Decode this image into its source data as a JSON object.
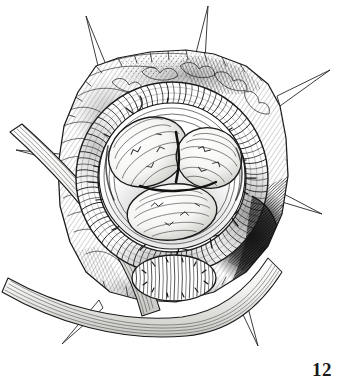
{
  "figure": {
    "number_label": "12",
    "caption": "Pen-and-ink surgical exposure: a ribbed coiled ring of tissue encircling three ovoid lobes within a retracted operative field.",
    "medium": "pen-and-ink line drawing",
    "background_color": "#ffffff",
    "ink_color": "#1a1a1a",
    "shadow_color": "#2b2b2b",
    "hatch_color": "#4a4a4a",
    "highlight_color": "#f7f7f5"
  },
  "illustration": {
    "canvas": {
      "width": 340,
      "height": 391
    },
    "field": {
      "name": "retracted-tissue-field",
      "outline": "M 96,66 L 118,58 L 150,52 L 186,50 L 214,54 L 246,66 L 268,84 L 280,106 L 286,138 L 288,176 L 282,214 L 268,246 L 246,272 L 214,292 L 176,302 L 140,300 L 110,292 L 86,272 L 70,242 L 60,206 L 58,166 L 64,126 L 78,92 Z",
      "description": "irregular polygonal wound margin held open"
    },
    "retractor_spikes": [
      {
        "name": "spike-top-left",
        "tip_x": 86,
        "tip_y": 16,
        "base_x": 104,
        "base_y": 70,
        "base_w": 9
      },
      {
        "name": "spike-top-right",
        "tip_x": 208,
        "tip_y": 6,
        "base_x": 200,
        "base_y": 58,
        "base_w": 9
      },
      {
        "name": "spike-right-upper",
        "tip_x": 330,
        "tip_y": 70,
        "base_x": 282,
        "base_y": 100,
        "base_w": 9
      },
      {
        "name": "spike-right-lower",
        "tip_x": 322,
        "tip_y": 214,
        "base_x": 284,
        "base_y": 200,
        "base_w": 8
      },
      {
        "name": "spike-bottom-right",
        "tip_x": 258,
        "tip_y": 346,
        "base_x": 240,
        "base_y": 300,
        "base_w": 8
      },
      {
        "name": "spike-bottom-left",
        "tip_x": 62,
        "tip_y": 344,
        "base_x": 96,
        "base_y": 298,
        "base_w": 8
      },
      {
        "name": "spike-left",
        "tip_x": 16,
        "tip_y": 150,
        "base_x": 60,
        "base_y": 160,
        "base_w": 8
      }
    ],
    "outer_ring": {
      "name": "coiled-ribbed-ring",
      "center_x": 172,
      "center_y": 178,
      "radius_outer": 96,
      "radius_inner": 74,
      "rib_count": 92,
      "description": "thick rope-like coil with transverse ribs and branching surface vessels"
    },
    "inner_basin": {
      "name": "inner-cavity-rim",
      "center_x": 172,
      "center_y": 176,
      "radius": 72
    },
    "lobes": [
      {
        "name": "lobe-upper-left",
        "cx": 148,
        "cy": 152,
        "rx": 41,
        "ry": 33,
        "rot": -28,
        "label": "upper-left ovoid lobe"
      },
      {
        "name": "lobe-upper-right",
        "cx": 209,
        "cy": 158,
        "rx": 33,
        "ry": 30,
        "rot": 18,
        "label": "upper-right ovoid lobe"
      },
      {
        "name": "lobe-lower",
        "cx": 172,
        "cy": 212,
        "rx": 45,
        "ry": 28,
        "rot": -6,
        "label": "lower ovoid lobe"
      }
    ],
    "lower_ribbed_lobe": {
      "name": "inferior-ribbed-lobe",
      "cx": 174,
      "cy": 278,
      "rx": 42,
      "ry": 23,
      "rib_count": 22,
      "label": "inferior ribbed lobe outside the ring"
    },
    "bands": [
      {
        "name": "band-upper-diagonal",
        "path": "M 18,140 L 96,236 L 126,284 L 140,316",
        "width": 20,
        "label": "upper fascial band crossing lower left"
      },
      {
        "name": "band-lower-diagonal",
        "path": "M 6,300 L 70,330 L 150,342 L 228,316 L 276,276",
        "width": 22,
        "label": "lower muscular band crossing field"
      }
    ],
    "shadow_zones": [
      {
        "name": "shadow-right-deep",
        "cx": 252,
        "cy": 236,
        "rx": 40,
        "ry": 46,
        "intensity": 0.88
      },
      {
        "name": "shadow-upper-left-rim",
        "cx": 106,
        "cy": 120,
        "rx": 34,
        "ry": 42,
        "intensity": 0.45
      },
      {
        "name": "shadow-bottom-trough",
        "cx": 168,
        "cy": 300,
        "rx": 72,
        "ry": 24,
        "intensity": 0.5
      }
    ]
  }
}
